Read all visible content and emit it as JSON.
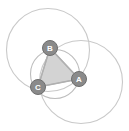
{
  "diagram": {
    "background_color": "#ffffff",
    "canvas": {
      "width": 129,
      "height": 131
    }
  },
  "chart_data": {
    "type": "diagram",
    "xlabel": "",
    "ylabel": "",
    "xlim": [
      0,
      129
    ],
    "ylim": [
      0,
      131
    ],
    "grid": false,
    "legend": "none",
    "nodes": [
      {
        "id": "A",
        "label": "A",
        "x": 79,
        "y": 79,
        "radius": 7.5,
        "fill": "#8a8a8a",
        "stroke": "#6e6e6e",
        "label_color": "#ffffff"
      },
      {
        "id": "B",
        "label": "B",
        "x": 50,
        "y": 48,
        "radius": 7.5,
        "fill": "#8a8a8a",
        "stroke": "#6e6e6e",
        "label_color": "#ffffff"
      },
      {
        "id": "C",
        "label": "C",
        "x": 38,
        "y": 87,
        "radius": 7.5,
        "fill": "#8a8a8a",
        "stroke": "#6e6e6e",
        "label_color": "#ffffff"
      }
    ],
    "edges": [
      {
        "from": "A",
        "to": "B"
      },
      {
        "from": "B",
        "to": "C"
      },
      {
        "from": "C",
        "to": "A"
      }
    ],
    "polygon": {
      "name": "triangle-ABC",
      "points": "79,79 50,48 38,87",
      "fill": "#d3d3d3",
      "stroke": "#b0b0b0",
      "stroke_width": 1.4
    },
    "circles": [
      {
        "name": "circle-left",
        "cx": 48,
        "cy": 50,
        "r": 41.5,
        "stroke": "#c9c9c9",
        "stroke_width": 1.1,
        "fill": "none"
      },
      {
        "name": "circle-right",
        "cx": 81,
        "cy": 82,
        "r": 41.5,
        "stroke": "#c9c9c9",
        "stroke_width": 1.1,
        "fill": "none"
      },
      {
        "name": "circle-inner",
        "cx": 55,
        "cy": 74,
        "r": 24.5,
        "stroke": "#bdbdbd",
        "stroke_width": 1.1,
        "fill": "none"
      }
    ],
    "colors": {
      "node_fill": "#8a8a8a",
      "node_label": "#ffffff",
      "triangle_fill": "#d3d3d3",
      "triangle_stroke": "#b0b0b0",
      "circle_stroke": "#c9c9c9",
      "background": "#ffffff"
    }
  }
}
